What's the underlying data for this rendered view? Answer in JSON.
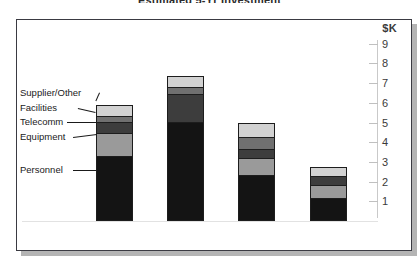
{
  "chart_data": {
    "type": "bar",
    "title": "Estimated 5-Yr Investment",
    "subtitle": "",
    "xlabel": "",
    "ylabel": "$K",
    "unit_label": "$K",
    "stacked": true,
    "grid": false,
    "legend_position": "left-callouts",
    "ylim": [
      0,
      9.5
    ],
    "yticks": [
      1,
      2,
      3,
      4,
      5,
      6,
      7,
      8,
      9
    ],
    "ytick_labels": [
      "1",
      "2",
      "3",
      "4",
      "5",
      "6",
      "7",
      "8",
      "9"
    ],
    "categories": [
      "Bar 1",
      "Bar 2",
      "Bar 3",
      "Bar 4"
    ],
    "series": [
      {
        "name": "Personnel",
        "color": "#141414",
        "values": [
          3.3,
          5.05,
          2.35,
          1.15
        ]
      },
      {
        "name": "Equipment",
        "color": "#9a9a9a",
        "values": [
          1.15,
          0.0,
          0.85,
          0.7
        ]
      },
      {
        "name": "Telecomm",
        "color": "#3d3d3d",
        "values": [
          0.6,
          1.4,
          0.45,
          0.45
        ]
      },
      {
        "name": "Facilities",
        "color": "#707070",
        "values": [
          0.3,
          0.35,
          0.6,
          0.0
        ]
      },
      {
        "name": "Supplier/Other",
        "color": "#d2d2d2",
        "values": [
          0.55,
          0.55,
          0.75,
          0.45
        ]
      }
    ],
    "totals": [
      5.9,
      7.35,
      5.0,
      2.75
    ],
    "annotations": [
      "Supplier/Other",
      "Facilities",
      "Telecomm",
      "Equipment",
      "Personnel"
    ]
  },
  "axis": {
    "unit": "$K",
    "ticks": [
      {
        "label": "9"
      },
      {
        "label": "8"
      },
      {
        "label": "7"
      },
      {
        "label": "6"
      },
      {
        "label": "5"
      },
      {
        "label": "4"
      },
      {
        "label": "3"
      },
      {
        "label": "2"
      },
      {
        "label": "1"
      }
    ]
  },
  "legend": {
    "items": [
      {
        "label": "Supplier/Other"
      },
      {
        "label": "Facilities"
      },
      {
        "label": "Telecomm"
      },
      {
        "label": "Equipment"
      },
      {
        "label": "Personnel"
      }
    ]
  },
  "colors": {
    "panel_border": "#3a3a42",
    "panel_background": "#ffffff",
    "shadow": "#b4b4b4",
    "axis": "#c9c9c9",
    "text": "#1a1a1a"
  }
}
